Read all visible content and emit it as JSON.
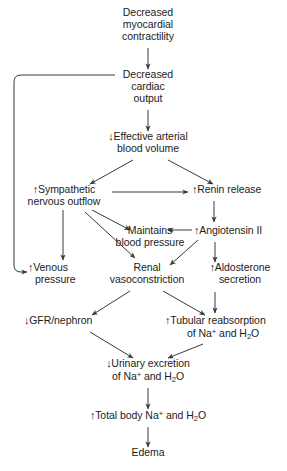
{
  "diagram": {
    "line_color": "#3a3a3a",
    "text_color": "#1c1c1c",
    "background": "#ffffff",
    "up_arrow": "↑",
    "down_arrow": "↓"
  },
  "nodes": {
    "myocardial_contractility": {
      "line1": "Decreased",
      "line2": "myocardial",
      "line3": "contractility"
    },
    "cardiac_output": {
      "line1": "Decreased",
      "line2": "cardiac",
      "line3": "output"
    },
    "arterial_blood_volume": {
      "marker": "↓",
      "line1": "Effective arterial",
      "line2": "blood volume"
    },
    "sympathetic_outflow": {
      "marker": "↑",
      "line1": "Sympathetic",
      "line2": "nervous outflow"
    },
    "renin_release": {
      "marker": "↑",
      "line1": "Renin release"
    },
    "maintains_blood_pressure": {
      "line1": "Maintains",
      "line2": "blood  pressure"
    },
    "angiotensin_ii": {
      "marker": "↑",
      "line1": "Angiotensin II"
    },
    "venous_pressure": {
      "marker": "↑",
      "line1": "Venous",
      "line2": "pressure"
    },
    "renal_vasoconstriction": {
      "line1": "Renal",
      "line2": "vasoconstriction"
    },
    "aldosterone_secretion": {
      "marker": "↑",
      "line1": "Aldosterone",
      "line2": "secretion"
    },
    "gfr_nephron": {
      "marker": "↓",
      "line1": "GFR/nephron"
    },
    "tubular_reabsorption": {
      "marker": "↑",
      "line1": "Tubular reabsorption",
      "line2_pre": "of Na",
      "line2_sup": "+",
      "line2_mid": " and H",
      "line2_sub": "2",
      "line2_post": "O"
    },
    "urinary_excretion": {
      "marker": "↓",
      "line1": "Urinary excretion",
      "line2_pre": "of Na",
      "line2_sup": "+",
      "line2_mid": " and H",
      "line2_sub": "2",
      "line2_post": "O"
    },
    "total_body_sodium": {
      "marker": "↑",
      "line1_pre": "Total body Na",
      "line1_sup": "+",
      "line1_mid": " and H",
      "line1_sub": "2",
      "line1_post": "O"
    },
    "edema": {
      "line1": "Edema"
    }
  }
}
